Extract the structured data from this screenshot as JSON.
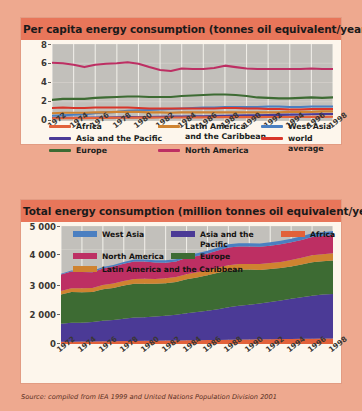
{
  "colors": {
    "background": "#eea98f",
    "panel": "#fdf6ec",
    "title_band": "#e8765a",
    "plot_bg": "#c2c0bb",
    "africa": "#e2613a",
    "latin_america": "#cf8330",
    "west_asia": "#4a7fc1",
    "asia_pacific": "#4b3a96",
    "europe": "#3d6b33",
    "north_america": "#bd2f63",
    "world_average": "#d8352a"
  },
  "chart1": {
    "title": "Per capita energy consumption (tonnes oil equivalent/year)",
    "legend": [
      {
        "label": "Africa",
        "color": "#e2613a"
      },
      {
        "label": "Asia and the Pacific",
        "color": "#4b3a96"
      },
      {
        "label": "Europe",
        "color": "#3d6b33"
      },
      {
        "label": "Latin America\nand the Caribbean",
        "color": "#cf8330"
      },
      {
        "label": "North America",
        "color": "#bd2f63"
      },
      {
        "label": "West Asia",
        "color": "#4a7fc1"
      },
      {
        "label": "world average",
        "color": "#d8352a"
      }
    ]
  },
  "chart2": {
    "title": "Total energy consumption (million tonnes oil equivalent/year)",
    "legend": [
      {
        "label": "West Asia",
        "color": "#4a7fc1"
      },
      {
        "label": "Asia and the Pacific",
        "color": "#4b3a96"
      },
      {
        "label": "Africa",
        "color": "#e2613a"
      },
      {
        "label": "North America",
        "color": "#bd2f63"
      },
      {
        "label": "Europe",
        "color": "#3d6b33"
      },
      {
        "label": "Latin America and the Caribbean",
        "color": "#cf8330"
      }
    ]
  },
  "source": "Source: compiled from IEA 1999 and United Nations Population Division 2001",
  "chart_data": [
    {
      "id": "per-capita-energy-consumption",
      "type": "line",
      "title": "Per capita energy consumption (tonnes oil equivalent/year)",
      "xlabel": "",
      "ylabel": "tonnes oil equivalent/year",
      "ylim": [
        0,
        8
      ],
      "yticks": [
        0,
        2,
        4,
        6,
        8
      ],
      "grid": true,
      "legend_position": "below",
      "x": [
        1972,
        1973,
        1974,
        1975,
        1976,
        1977,
        1978,
        1979,
        1980,
        1981,
        1982,
        1983,
        1984,
        1985,
        1986,
        1987,
        1988,
        1989,
        1990,
        1991,
        1992,
        1993,
        1994,
        1995,
        1996,
        1997,
        1998
      ],
      "xticks": [
        1972,
        1974,
        1976,
        1978,
        1980,
        1982,
        1984,
        1986,
        1988,
        1990,
        1992,
        1994,
        1996,
        1998
      ],
      "series": [
        {
          "name": "North America",
          "color": "#bd2f63",
          "values": [
            6.05,
            6.0,
            5.85,
            5.6,
            5.85,
            5.95,
            6.0,
            6.1,
            5.95,
            5.6,
            5.3,
            5.2,
            5.45,
            5.4,
            5.4,
            5.5,
            5.75,
            5.6,
            5.45,
            5.4,
            5.4,
            5.4,
            5.4,
            5.4,
            5.45,
            5.4,
            5.4
          ]
        },
        {
          "name": "Europe",
          "color": "#3d6b33",
          "values": [
            2.2,
            2.3,
            2.3,
            2.3,
            2.4,
            2.45,
            2.5,
            2.55,
            2.55,
            2.5,
            2.5,
            2.5,
            2.6,
            2.65,
            2.7,
            2.75,
            2.75,
            2.7,
            2.6,
            2.45,
            2.4,
            2.35,
            2.35,
            2.4,
            2.45,
            2.4,
            2.45
          ]
        },
        {
          "name": "West Asia",
          "color": "#4a7fc1",
          "values": [
            0.55,
            0.6,
            0.65,
            0.7,
            0.8,
            0.9,
            0.95,
            1.05,
            1.1,
            1.15,
            1.2,
            1.25,
            1.3,
            1.35,
            1.4,
            1.4,
            1.45,
            1.45,
            1.45,
            1.45,
            1.5,
            1.5,
            1.45,
            1.45,
            1.5,
            1.5,
            1.5
          ]
        },
        {
          "name": "world average",
          "color": "#d8352a",
          "values": [
            1.35,
            1.4,
            1.35,
            1.35,
            1.4,
            1.4,
            1.4,
            1.4,
            1.35,
            1.3,
            1.3,
            1.3,
            1.3,
            1.3,
            1.3,
            1.3,
            1.35,
            1.35,
            1.3,
            1.3,
            1.25,
            1.25,
            1.2,
            1.2,
            1.25,
            1.25,
            1.25
          ]
        },
        {
          "name": "Latin America and the Caribbean",
          "color": "#cf8330",
          "values": [
            0.8,
            0.85,
            0.85,
            0.85,
            0.9,
            0.9,
            0.95,
            0.95,
            0.95,
            0.9,
            0.9,
            0.85,
            0.9,
            0.9,
            0.9,
            0.9,
            0.9,
            0.9,
            0.9,
            0.9,
            0.9,
            0.9,
            0.95,
            0.95,
            0.95,
            1.0,
            1.0
          ]
        },
        {
          "name": "Asia and the Pacific",
          "color": "#4b3a96",
          "values": [
            0.3,
            0.32,
            0.32,
            0.33,
            0.35,
            0.36,
            0.38,
            0.4,
            0.4,
            0.42,
            0.43,
            0.45,
            0.47,
            0.48,
            0.5,
            0.52,
            0.55,
            0.57,
            0.58,
            0.6,
            0.62,
            0.64,
            0.66,
            0.68,
            0.7,
            0.72,
            0.72
          ]
        },
        {
          "name": "Africa",
          "color": "#e2613a",
          "values": [
            0.28,
            0.29,
            0.3,
            0.3,
            0.31,
            0.32,
            0.33,
            0.34,
            0.35,
            0.35,
            0.36,
            0.36,
            0.37,
            0.38,
            0.38,
            0.39,
            0.4,
            0.4,
            0.4,
            0.4,
            0.41,
            0.41,
            0.42,
            0.42,
            0.43,
            0.43,
            0.44
          ]
        }
      ]
    },
    {
      "id": "total-energy-consumption",
      "type": "area",
      "stacked": true,
      "title": "Total energy consumption (million tonnes oil equivalent/year)",
      "xlabel": "",
      "ylabel": "million tonnes oil equivalent/year",
      "ylim": [
        0,
        5000
      ],
      "yticks": [
        0,
        2000,
        3000,
        4000,
        5000
      ],
      "ytick_labels": [
        "0",
        "2 000",
        "3 000",
        "4 000",
        "5 000"
      ],
      "grid": true,
      "legend_position": "inside-top",
      "x": [
        1972,
        1973,
        1974,
        1975,
        1976,
        1977,
        1978,
        1979,
        1980,
        1981,
        1982,
        1983,
        1984,
        1985,
        1986,
        1987,
        1988,
        1989,
        1990,
        1991,
        1992,
        1993,
        1994,
        1995,
        1996,
        1997,
        1998
      ],
      "xticks": [
        1972,
        1974,
        1976,
        1978,
        1980,
        1982,
        1984,
        1986,
        1988,
        1990,
        1992,
        1994,
        1996,
        1998
      ],
      "stack_order": [
        "Africa",
        "Asia and the Pacific",
        "Europe",
        "Latin America and the Caribbean",
        "North America",
        "West Asia"
      ],
      "series": [
        {
          "name": "Africa",
          "color": "#e2613a",
          "values": [
            95,
            100,
            105,
            108,
            112,
            118,
            124,
            130,
            136,
            140,
            146,
            150,
            156,
            162,
            168,
            174,
            182,
            188,
            193,
            198,
            203,
            208,
            214,
            220,
            226,
            232,
            238
          ]
        },
        {
          "name": "Asia and the Pacific",
          "color": "#4b3a96",
          "values": [
            760,
            800,
            800,
            820,
            870,
            900,
            950,
            990,
            1000,
            1020,
            1050,
            1090,
            1150,
            1190,
            1240,
            1300,
            1370,
            1430,
            1470,
            1520,
            1580,
            1640,
            1700,
            1760,
            1820,
            1870,
            1880
          ]
        },
        {
          "name": "Europe",
          "color": "#3d6b33",
          "values": [
            1240,
            1300,
            1290,
            1280,
            1340,
            1360,
            1400,
            1430,
            1420,
            1390,
            1380,
            1390,
            1440,
            1470,
            1500,
            1540,
            1550,
            1530,
            1490,
            1420,
            1390,
            1370,
            1370,
            1390,
            1420,
            1400,
            1420
          ]
        },
        {
          "name": "Latin America and the Caribbean",
          "color": "#cf8330",
          "values": [
            150,
            160,
            165,
            170,
            180,
            188,
            196,
            202,
            206,
            204,
            206,
            204,
            212,
            216,
            222,
            228,
            234,
            238,
            242,
            248,
            254,
            260,
            272,
            282,
            292,
            302,
            312
          ]
        },
        {
          "name": "North America",
          "color": "#bd2f63",
          "values": [
            700,
            710,
            690,
            665,
            700,
            718,
            730,
            748,
            735,
            700,
            665,
            658,
            696,
            694,
            700,
            718,
            758,
            748,
            734,
            734,
            740,
            746,
            752,
            758,
            772,
            770,
            776
          ]
        },
        {
          "name": "West Asia",
          "color": "#4a7fc1",
          "values": [
            35,
            40,
            45,
            50,
            58,
            66,
            72,
            80,
            86,
            92,
            98,
            104,
            112,
            118,
            124,
            128,
            134,
            138,
            140,
            142,
            148,
            152,
            152,
            154,
            160,
            162,
            164
          ]
        }
      ]
    }
  ]
}
